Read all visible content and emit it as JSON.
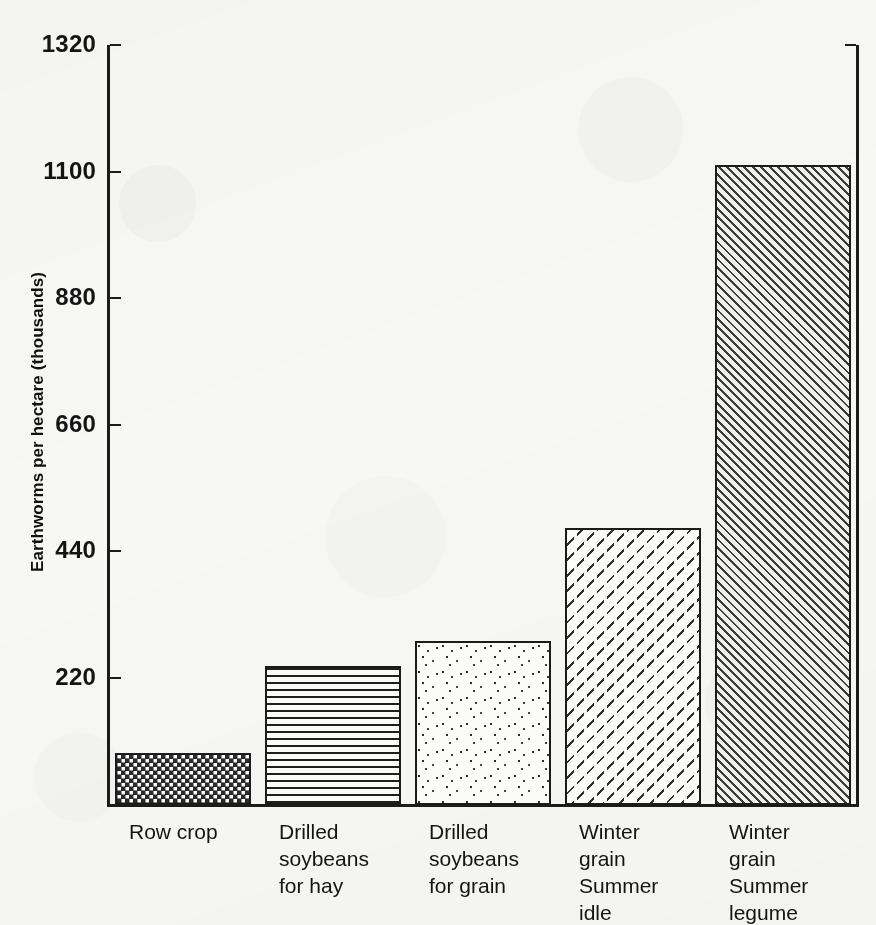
{
  "chart_data": {
    "type": "bar",
    "title": "",
    "xlabel": "",
    "ylabel": "Earthworms per hectare (thousands)",
    "categories": [
      "Row crop",
      "Drilled soybeans for hay",
      "Drilled soybeans for grain",
      "Winter grain Summer idle",
      "Winter grain Summer legume"
    ],
    "category_lines": [
      [
        "Row crop"
      ],
      [
        "Drilled",
        "soybeans",
        "for hay"
      ],
      [
        "Drilled",
        "soybeans",
        "for grain"
      ],
      [
        "Winter",
        "grain",
        "Summer",
        "idle"
      ],
      [
        "Winter",
        "grain",
        "Summer",
        "legume"
      ]
    ],
    "values": [
      91,
      242,
      285,
      481,
      1113
    ],
    "ylim": [
      0,
      1320
    ],
    "ytick_values": [
      220,
      440,
      660,
      880,
      1100,
      1320
    ],
    "ytick_labels": [
      "220",
      "440",
      "660",
      "880",
      "1100",
      "1320"
    ],
    "grid": false,
    "legend": false,
    "bar_patterns": [
      "dense-checkerboard",
      "horizontal-lines",
      "stipple-dots",
      "sparse-backslash-dashes",
      "dense-diagonal-hatch"
    ]
  },
  "style": {
    "background": "#f7f7f5",
    "ink": "#1b1b1b",
    "bar_outline": "#1b1b1b"
  }
}
